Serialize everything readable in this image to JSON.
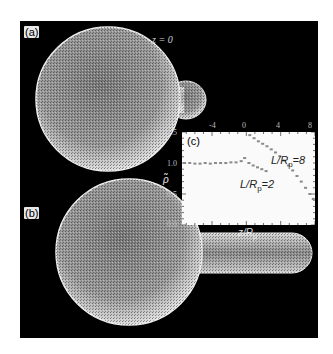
{
  "figure": {
    "panels": [
      {
        "id": "a",
        "label": "(a)",
        "annotation": "z = 0"
      },
      {
        "id": "b",
        "label": "(b)"
      },
      {
        "id": "c",
        "label": "(c)"
      }
    ]
  },
  "chart_data": {
    "type": "scatter",
    "title": "(c)",
    "xlabel": "z/R_p",
    "ylabel": "ρ̃",
    "xlim": [
      -7.5,
      8
    ],
    "ylim": [
      0.0,
      1.5
    ],
    "xticks": [
      "-4",
      "0",
      "4",
      "8"
    ],
    "yticks": [
      "0.0",
      "0.5",
      "1.0",
      "1.5"
    ],
    "grid": false,
    "legend": "inline annotations",
    "series": [
      {
        "name": "L/R_p=2",
        "label_main": "L/R",
        "label_sub": "p",
        "label_tail": "=2",
        "color": "#8a8a8a",
        "x": [
          -7.2,
          -6.6,
          -6.0,
          -5.4,
          -4.8,
          -4.2,
          -3.6,
          -3.0,
          -2.4,
          -1.8,
          -1.2,
          -0.6,
          -0.2,
          0.3,
          0.8,
          1.3,
          1.8,
          2.3
        ],
        "y": [
          1.0,
          1.0,
          0.99,
          0.99,
          1.0,
          0.99,
          1.0,
          1.0,
          1.0,
          1.01,
          1.01,
          1.03,
          1.08,
          1.0,
          0.96,
          0.93,
          0.9,
          0.87
        ]
      },
      {
        "name": "L/R_p=8",
        "label_main": "L/R",
        "label_sub": "p",
        "label_tail": "=8",
        "color": "#8a8a8a",
        "x": [
          0.4,
          0.9,
          1.4,
          1.9,
          2.4,
          2.9,
          3.4,
          3.9,
          4.4,
          4.9,
          5.4,
          5.9,
          6.4,
          6.9,
          7.4,
          7.8
        ],
        "y": [
          1.45,
          1.4,
          1.35,
          1.31,
          1.27,
          1.22,
          1.17,
          1.11,
          1.04,
          0.96,
          0.88,
          0.79,
          0.7,
          0.6,
          0.5,
          0.42
        ]
      }
    ]
  }
}
